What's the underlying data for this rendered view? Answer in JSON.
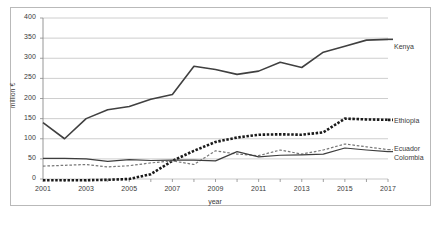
{
  "chart_data": {
    "type": "line",
    "title": "",
    "xlabel": "year",
    "ylabel": "million €",
    "xlim": [
      2001,
      2017
    ],
    "ylim": [
      0,
      400
    ],
    "ytick_values": [
      0,
      50,
      100,
      150,
      200,
      250,
      300,
      350,
      400
    ],
    "ytick_labels": [
      "0",
      "50",
      "100",
      "150",
      "200",
      "250",
      "300",
      "350",
      "400"
    ],
    "xtick_values": [
      2001,
      2003,
      2005,
      2007,
      2009,
      2011,
      2013,
      2015,
      2017
    ],
    "xtick_labels": [
      "2001",
      "2003",
      "2005",
      "2007",
      "2009",
      "2011",
      "2013",
      "2015",
      "2017"
    ],
    "x": [
      2001,
      2002,
      2003,
      2004,
      2005,
      2006,
      2007,
      2008,
      2009,
      2010,
      2011,
      2012,
      2013,
      2014,
      2015,
      2016,
      2017
    ],
    "grid": "horizontal",
    "legend_position": "right-of-plot-at-line-end",
    "series": [
      {
        "name": "Kenya",
        "style": "solid",
        "color": "#404040",
        "width": 1.6,
        "values": [
          140,
          100,
          150,
          172,
          180,
          198,
          210,
          280,
          272,
          260,
          268,
          290,
          277,
          315,
          330,
          345,
          347
        ]
      },
      {
        "name": "Ethiopia",
        "style": "dotted-thick",
        "color": "#1a1a1a",
        "width": 2.6,
        "values": [
          -3,
          -3,
          -3,
          -2,
          0,
          12,
          45,
          70,
          92,
          103,
          110,
          111,
          110,
          116,
          150,
          148,
          147
        ]
      },
      {
        "name": "Ecuador",
        "style": "dashed",
        "color": "#777777",
        "width": 1.2,
        "values": [
          32,
          34,
          36,
          30,
          33,
          40,
          45,
          36,
          70,
          62,
          58,
          72,
          62,
          72,
          87,
          80,
          73
        ]
      },
      {
        "name": "Colombia",
        "style": "solid",
        "color": "#3d3d3d",
        "width": 1.2,
        "values": [
          51,
          51,
          50,
          44,
          48,
          46,
          47,
          47,
          45,
          68,
          55,
          59,
          60,
          62,
          77,
          72,
          68
        ]
      }
    ]
  },
  "axis": {
    "ylabel": "million €",
    "xlabel": "year"
  },
  "legend": {
    "kenya": "Kenya",
    "ethiopia": "Ethiopia",
    "ecuador": "Ecuador",
    "colombia": "Colombia"
  }
}
